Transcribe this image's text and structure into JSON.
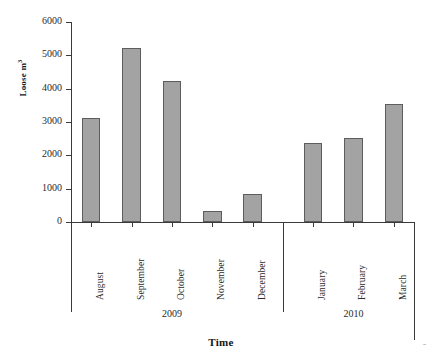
{
  "chart_data": {
    "type": "bar",
    "title": "",
    "subtitle": "",
    "xlabel": "Time",
    "ylabel": "Loose m³",
    "ylabel_base": "Loose m",
    "ylabel_exponent": "3",
    "categories": [
      "August",
      "September",
      "October",
      "November",
      "December",
      "January",
      "February",
      "March"
    ],
    "values": [
      3120,
      5220,
      4220,
      330,
      850,
      2370,
      2530,
      3530
    ],
    "groups": [
      {
        "label": "2009",
        "categories": [
          "August",
          "September",
          "October",
          "November",
          "December"
        ]
      },
      {
        "label": "2010",
        "categories": [
          "January",
          "February",
          "March"
        ]
      }
    ],
    "ylim": [
      0,
      6000
    ],
    "yticks": [
      0,
      1000,
      2000,
      3000,
      4000,
      5000,
      6000
    ],
    "ytick_labels": [
      "0",
      "1000",
      "2000",
      "3000",
      "4000",
      "5000",
      "6000"
    ],
    "grid": false,
    "legend": "none",
    "bar_fill": "#a3a3a3",
    "bar_edge": "#5d5d5d",
    "axis_color": "#3a3a3a",
    "background": "#ffffff"
  },
  "figure": {
    "corner_mark": "ˉ"
  }
}
